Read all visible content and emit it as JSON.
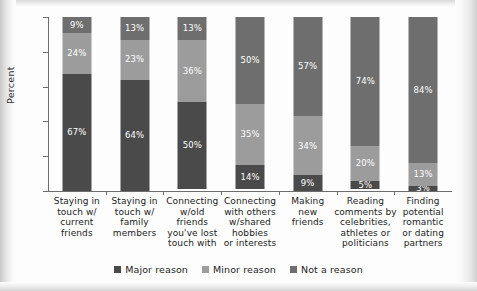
{
  "chart_data": {
    "type": "bar",
    "subtype": "stacked-100-percent",
    "title": "",
    "xlabel": "",
    "ylabel": "Percent",
    "ylim": [
      0,
      100
    ],
    "yticks": [
      100,
      80,
      60,
      40,
      20,
      0
    ],
    "grid": false,
    "legend_position": "bottom-center",
    "categories": [
      "Staying in touch w/ current friends",
      "Staying in touch w/ family members",
      "Connecting w/old friends you've lost touch with",
      "Connecting with others w/shared hobbies or interests",
      "Making new friends",
      "Reading comments by celebrities, athletes or politicians",
      "Finding potential romantic or dating partners"
    ],
    "category_lines": [
      [
        "Staying in",
        "touch w/",
        "current",
        "friends"
      ],
      [
        "Staying in",
        "touch w/",
        "family",
        "members"
      ],
      [
        "Connecting",
        "w/old",
        "friends",
        "you've lost",
        "touch with"
      ],
      [
        "Connecting",
        "with others",
        "w/shared",
        "hobbies",
        "or interests"
      ],
      [
        "Making",
        "new",
        "friends"
      ],
      [
        "Reading",
        "comments by",
        "celebrities,",
        "athletes or",
        "politicians"
      ],
      [
        "Finding",
        "potential",
        "romantic",
        "or dating",
        "partners"
      ]
    ],
    "series": [
      {
        "name": "Major reason",
        "color": "#4a4a4a",
        "values": [
          67,
          64,
          50,
          14,
          9,
          5,
          3
        ],
        "labels": [
          "67%",
          "64%",
          "50%",
          "14%",
          "9%",
          "5%",
          "3%"
        ]
      },
      {
        "name": "Minor reason",
        "color": "#9c9c9c",
        "values": [
          24,
          23,
          36,
          35,
          34,
          20,
          13
        ],
        "labels": [
          "24%",
          "23%",
          "36%",
          "35%",
          "34%",
          "20%",
          "13%"
        ]
      },
      {
        "name": "Not a reason",
        "color": "#6e6e6e",
        "values": [
          9,
          13,
          13,
          50,
          57,
          74,
          84
        ],
        "labels": [
          "9%",
          "13%",
          "13%",
          "50%",
          "57%",
          "74%",
          "84%"
        ]
      }
    ]
  },
  "legend": {
    "items": [
      {
        "label": "Major reason",
        "color": "#4a4a4a"
      },
      {
        "label": "Minor reason",
        "color": "#9c9c9c"
      },
      {
        "label": "Not a reason",
        "color": "#6e6e6e"
      }
    ]
  },
  "axis": {
    "y_title": "Percent",
    "y_tick_labels": [
      "100",
      "80",
      "60",
      "40",
      "20",
      "0"
    ]
  }
}
